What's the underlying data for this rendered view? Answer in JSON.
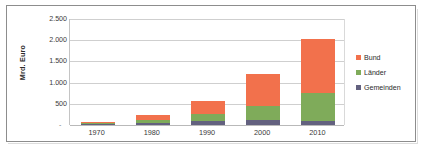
{
  "chart_data": {
    "type": "bar",
    "subtype": "stacked-column",
    "title": "",
    "xlabel": "",
    "ylabel": "Mrd. Euro",
    "categories": [
      "1970",
      "1980",
      "1990",
      "2000",
      "2010"
    ],
    "series": [
      {
        "name": "Gemeinden",
        "color": "#63617F",
        "values": [
          20,
          55,
          100,
          120,
          95
        ]
      },
      {
        "name": "Länder",
        "color": "#7FAB5A",
        "values": [
          25,
          65,
          170,
          340,
          655
        ]
      },
      {
        "name": "Bund",
        "color": "#F2714C",
        "values": [
          15,
          125,
          290,
          755,
          1285
        ]
      }
    ],
    "totals": [
      60,
      245,
      560,
      1215,
      2035
    ],
    "ylim": [
      0,
      2500
    ],
    "y_ticks": [
      "-",
      "500",
      "1.000",
      "1.500",
      "2.000",
      "2.500"
    ],
    "y_tick_values": [
      0,
      500,
      1000,
      1500,
      2000,
      2500
    ],
    "grid": true,
    "legend_position": "right",
    "legend": [
      "Bund",
      "Länder",
      "Gemeinden"
    ]
  },
  "axis": {
    "y_title": "Mrd. Euro",
    "zero_mark": "-"
  }
}
